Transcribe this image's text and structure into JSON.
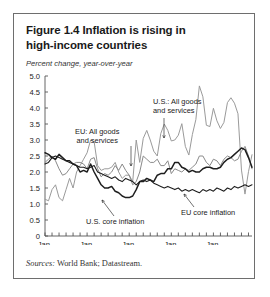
{
  "figure": {
    "title_line1": "Figure 1.4  Inflation is rising in",
    "title_line2": "high-income countries",
    "axis_note": "Percent change, year-over-year",
    "sources_label": "Sources:",
    "sources_text": " World Bank; Datastream."
  },
  "annotations": {
    "us_all_line1": "U.S.: All goods",
    "us_all_line2": "and services",
    "eu_all_line1": "EU: All goods",
    "eu_all_line2": "and services",
    "us_core": "U.S. core inflation",
    "eu_core": "EU core inflation"
  },
  "chart_data": {
    "type": "line",
    "title": "Figure 1.4  Inflation is rising in high-income countries",
    "subtitle": "Percent change, year-over-year",
    "xlabel": "",
    "ylabel": "Percent change, year-over-year",
    "ylim": [
      0,
      5.0
    ],
    "yticks": [
      "0",
      "0.5",
      "1.0",
      "1.5",
      "2.0",
      "2.5",
      "3.0",
      "3.5",
      "4.0",
      "4.5",
      "5.0"
    ],
    "ytick_values": [
      0,
      0.5,
      1.0,
      1.5,
      2.0,
      2.5,
      3.0,
      3.5,
      4.0,
      4.5,
      5.0
    ],
    "xticks": [
      "Jan. 2002",
      "Jan. 2003",
      "Jan. 2004",
      "Jan. 2005",
      "Jan. 2006"
    ],
    "xtick_line1": [
      "Jan.",
      "Jan.",
      "Jan.",
      "Jan.",
      "Jan."
    ],
    "xtick_line2": [
      "2002",
      "2003",
      "2004",
      "2005",
      "2006"
    ],
    "minor_tick_interval_months": 2,
    "x_start": "2002-01",
    "x_end": "2006-09",
    "grid": false,
    "legend_position": "inline-annotations",
    "series": [
      {
        "name": "U.S.: All goods and services",
        "color": "#9a9a9a",
        "width": 1.0,
        "values": [
          1.15,
          1.1,
          1.45,
          1.6,
          1.2,
          1.1,
          1.45,
          1.8,
          1.5,
          2.0,
          2.2,
          2.4,
          2.6,
          3.0,
          2.95,
          2.2,
          2.05,
          2.1,
          2.1,
          2.15,
          2.3,
          2.0,
          1.8,
          1.9,
          1.9,
          1.7,
          3.0,
          2.3,
          3.05,
          3.3,
          3.0,
          2.65,
          2.5,
          3.2,
          3.5,
          3.3,
          2.97,
          3.0,
          3.15,
          3.51,
          2.8,
          2.53,
          3.17,
          3.64,
          4.69,
          4.35,
          3.46,
          3.42,
          3.99,
          3.6,
          3.36,
          3.55,
          4.17,
          4.32,
          4.15,
          3.82,
          2.06,
          1.31,
          2.01,
          2.54
        ]
      },
      {
        "name": "EU: All goods and services",
        "color": "#8a8a8a",
        "width": 1.0,
        "values": [
          2.3,
          2.4,
          2.5,
          2.35,
          2.1,
          1.9,
          1.95,
          2.1,
          2.25,
          2.3,
          2.3,
          2.25,
          2.1,
          2.4,
          2.45,
          2.1,
          1.85,
          1.95,
          1.9,
          2.0,
          2.2,
          2.05,
          2.25,
          2.05,
          1.9,
          1.6,
          1.7,
          2.0,
          2.5,
          2.4,
          2.3,
          2.3,
          2.4,
          2.2,
          2.2,
          2.35,
          1.95,
          2.1,
          2.05,
          2.0,
          2.1,
          2.05,
          2.15,
          2.25,
          2.5,
          2.5,
          2.3,
          2.2,
          2.4,
          2.35,
          2.2,
          2.4,
          2.5,
          2.45,
          2.35,
          2.4,
          2.65,
          2.8,
          2.5,
          2.1
        ]
      },
      {
        "name": "U.S. core inflation",
        "color": "#1e1e1e",
        "width": 1.5,
        "values": [
          2.6,
          2.55,
          2.45,
          2.4,
          2.55,
          2.45,
          2.35,
          2.35,
          2.25,
          2.2,
          2.0,
          2.05,
          2.0,
          2.25,
          2.0,
          1.8,
          1.6,
          1.5,
          1.5,
          1.55,
          1.4,
          1.35,
          1.25,
          1.2,
          1.2,
          1.25,
          1.45,
          1.7,
          1.7,
          1.8,
          1.75,
          1.7,
          1.9,
          1.95,
          1.95,
          2.1,
          2.1,
          2.3,
          2.3,
          2.15,
          2.1,
          2.0,
          2.05,
          2.0,
          2.0,
          2.1,
          2.15,
          2.15,
          2.1,
          2.1,
          2.15,
          2.3,
          2.4,
          2.45,
          2.55,
          2.65,
          2.75,
          2.7,
          2.45,
          2.15
        ]
      },
      {
        "name": "EU core inflation",
        "color": "#1e1e1e",
        "width": 1.1,
        "values": [
          2.25,
          2.3,
          2.45,
          2.5,
          2.45,
          2.4,
          2.35,
          2.3,
          2.25,
          2.2,
          2.15,
          2.15,
          2.1,
          2.15,
          2.2,
          2.0,
          1.95,
          1.9,
          1.85,
          1.8,
          1.85,
          1.75,
          1.7,
          1.8,
          1.75,
          1.7,
          1.6,
          1.7,
          1.75,
          1.7,
          1.75,
          1.65,
          1.6,
          1.55,
          1.5,
          1.55,
          1.5,
          1.45,
          1.5,
          1.4,
          1.45,
          1.4,
          1.45,
          1.4,
          1.35,
          1.45,
          1.4,
          1.45,
          1.4,
          1.5,
          1.45,
          1.4,
          1.5,
          1.45,
          1.55,
          1.5,
          1.55,
          1.6,
          1.55,
          1.6
        ]
      }
    ]
  }
}
